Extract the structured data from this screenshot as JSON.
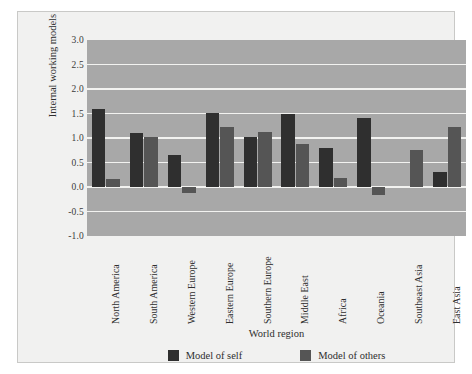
{
  "chart_data": {
    "type": "bar",
    "title": "",
    "xlabel": "World region",
    "ylabel": "Internal working models",
    "ylim": [
      -1.0,
      3.0
    ],
    "ytick_labels": [
      "3.0",
      "2.5",
      "2.0",
      "1.5",
      "1.0",
      "0.5",
      "0.0",
      "-0.5",
      "-1.0"
    ],
    "ytick_values": [
      3.0,
      2.5,
      2.0,
      1.5,
      1.0,
      0.5,
      0.0,
      -0.5,
      -1.0
    ],
    "grid": true,
    "legend_position": "bottom",
    "categories": [
      "North America",
      "South America",
      "Western Europe",
      "Eastern Europe",
      "Southern Europe",
      "Middle East",
      "Africa",
      "Oceania",
      "Southeast Asia",
      "East Asia"
    ],
    "series": [
      {
        "name": "Model of self",
        "color": "#2f2f2f",
        "values": [
          1.6,
          1.1,
          0.65,
          1.52,
          1.02,
          1.48,
          0.8,
          1.4,
          0.0,
          0.3
        ]
      },
      {
        "name": "Model of others",
        "color": "#555555",
        "values": [
          0.17,
          1.03,
          -0.13,
          1.22,
          1.13,
          0.87,
          0.18,
          -0.17,
          0.75,
          1.22
        ]
      }
    ]
  },
  "legend": {
    "entries": [
      {
        "label": "Model of self",
        "color": "#2f2f2f"
      },
      {
        "label": "Model of others",
        "color": "#555555"
      }
    ]
  },
  "colors": {
    "plot_background": "#a8a8a8",
    "panel_background": "#f1f1f0",
    "gridline": "#f2f2f0",
    "series_self": "#2f2f2f",
    "series_others": "#555555"
  }
}
